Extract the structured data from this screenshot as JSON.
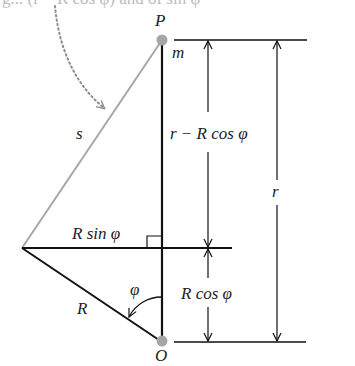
{
  "diagram": {
    "cut_off_caption": "g... (r − R cos φ) and of sin φ",
    "points": {
      "P": "P",
      "O": "O"
    },
    "labels": {
      "mass": "m",
      "s": "s",
      "r_minus_Rcos": "r − R cos φ",
      "r": "r",
      "R_sin": "R sin φ",
      "R_cos": "R cos φ",
      "R": "R",
      "phi": "φ"
    },
    "colors": {
      "line": "#111111",
      "gray_line": "#a6a6a6",
      "point": "#a6a6a6",
      "dotted_arrow": "#8c8c8c"
    }
  }
}
